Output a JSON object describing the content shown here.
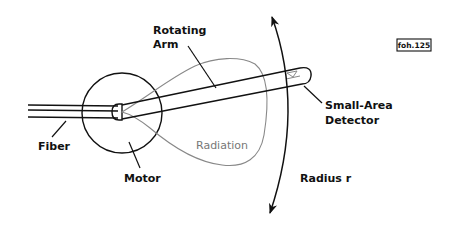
{
  "diagram": {
    "tag": "foh.125",
    "labels": {
      "rotating_arm_line1": "Rotating",
      "rotating_arm_line2": "Arm",
      "small_area_line1": "Small-Area",
      "small_area_line2": "Detector",
      "fiber": "Fiber",
      "motor": "Motor",
      "radiation": "Radiation",
      "radius": "Radius r"
    },
    "colors": {
      "stroke": "#111111",
      "radiation": "#888888",
      "background": "#ffffff"
    }
  }
}
